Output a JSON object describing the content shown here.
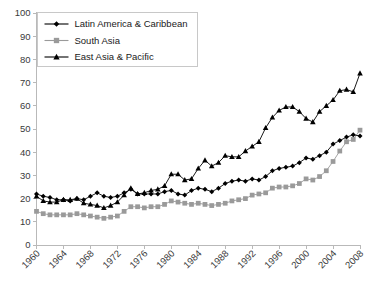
{
  "chart_data": {
    "type": "line",
    "title": "",
    "xlabel": "",
    "ylabel": "",
    "ylim": [
      0,
      100
    ],
    "xlim": [
      1960,
      2008
    ],
    "ytick_step": 10,
    "yticks": [
      0,
      10,
      20,
      30,
      40,
      50,
      60,
      70,
      80,
      90,
      100
    ],
    "ytick_labels": [
      "0",
      "10",
      "20",
      "30",
      "40",
      "50",
      "60",
      "70",
      "80",
      "90",
      "100"
    ],
    "xticks": [
      1960,
      1964,
      1968,
      1972,
      1976,
      1980,
      1984,
      1988,
      1992,
      1996,
      2000,
      2004,
      2008
    ],
    "xtick_labels": [
      "1960",
      "1964",
      "1968",
      "1972",
      "1976",
      "1980",
      "1984",
      "1988",
      "1992",
      "1996",
      "2000",
      "2004",
      "2008"
    ],
    "xtick_rotation_deg": 45,
    "grid": false,
    "legend_position": "upper-left-inside",
    "x": [
      1960,
      1961,
      1962,
      1963,
      1964,
      1965,
      1966,
      1967,
      1968,
      1969,
      1970,
      1971,
      1972,
      1973,
      1974,
      1975,
      1976,
      1977,
      1978,
      1979,
      1980,
      1981,
      1982,
      1983,
      1984,
      1985,
      1986,
      1987,
      1988,
      1989,
      1990,
      1991,
      1992,
      1993,
      1994,
      1995,
      1996,
      1997,
      1998,
      1999,
      2000,
      2001,
      2002,
      2003,
      2004,
      2005,
      2006,
      2007,
      2008
    ],
    "series": [
      {
        "name": "Latin America & Caribbean",
        "color": "#000000",
        "marker": "diamond",
        "values": [
          22.0,
          21.0,
          20.5,
          19.5,
          19.5,
          19.0,
          20.0,
          19.5,
          21.0,
          22.5,
          21.0,
          20.5,
          21.0,
          22.5,
          24.0,
          22.0,
          22.0,
          22.0,
          22.0,
          23.0,
          23.5,
          22.0,
          21.5,
          23.5,
          24.5,
          24.0,
          23.0,
          24.5,
          26.5,
          27.5,
          28.0,
          27.5,
          28.5,
          28.0,
          29.5,
          32.0,
          33.0,
          33.5,
          34.0,
          35.5,
          37.5,
          37.0,
          38.5,
          40.0,
          43.5,
          45.0,
          46.5,
          47.5,
          47.0
        ]
      },
      {
        "name": "South Asia",
        "color": "#9a9a9a",
        "marker": "square",
        "values": [
          14.5,
          13.5,
          13.0,
          13.0,
          13.0,
          13.0,
          13.5,
          13.0,
          12.5,
          12.0,
          11.5,
          12.0,
          12.5,
          14.5,
          16.5,
          16.5,
          16.0,
          16.5,
          16.5,
          17.5,
          19.0,
          18.5,
          18.0,
          17.5,
          18.0,
          17.5,
          17.0,
          17.5,
          18.0,
          19.0,
          19.5,
          20.0,
          21.5,
          22.0,
          22.5,
          24.5,
          25.0,
          25.0,
          25.5,
          26.5,
          28.5,
          28.0,
          29.5,
          32.0,
          36.0,
          40.5,
          44.5,
          45.5,
          49.5
        ]
      },
      {
        "name": "East Asia & Pacific",
        "color": "#000000",
        "marker": "triangle",
        "values": [
          21.0,
          19.0,
          18.5,
          18.5,
          19.5,
          19.5,
          20.0,
          18.0,
          17.5,
          17.0,
          16.0,
          17.0,
          18.5,
          21.5,
          24.5,
          22.0,
          22.5,
          23.5,
          24.0,
          25.5,
          30.5,
          30.5,
          28.0,
          28.5,
          33.0,
          36.5,
          34.0,
          35.5,
          38.5,
          38.0,
          38.0,
          40.5,
          42.5,
          44.5,
          50.5,
          55.0,
          58.0,
          59.5,
          59.5,
          57.5,
          54.5,
          53.0,
          57.5,
          60.0,
          62.5,
          66.5,
          67.0,
          66.0,
          74.0
        ]
      }
    ]
  },
  "legend": {
    "entries": [
      {
        "label": "Latin America & Caribbean"
      },
      {
        "label": "South Asia"
      },
      {
        "label": "East Asia & Pacific"
      }
    ]
  }
}
